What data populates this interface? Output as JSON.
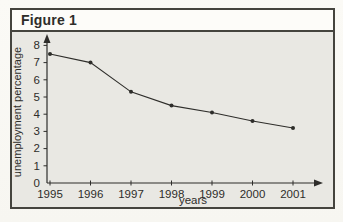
{
  "figure": {
    "label": "Figure 1"
  },
  "colors": {
    "page_bg": "#fbfaf6",
    "box_border": "#45443e",
    "header_bg": "#fdfcf9",
    "plot_bg": "#e9e8e3",
    "line": "#2e2d2a",
    "text": "#2e2d2a"
  },
  "chart_data": {
    "type": "line",
    "title": "Figure 1",
    "x": [
      1995,
      1996,
      1997,
      1998,
      1999,
      2000,
      2001
    ],
    "series": [
      {
        "name": "unemployment percentage",
        "values": [
          7.5,
          7.0,
          5.3,
          4.5,
          4.1,
          3.6,
          3.2
        ]
      }
    ],
    "xlabel": "years",
    "ylabel": "unemployment percentage",
    "ylim": [
      0,
      8
    ],
    "yticks": [
      0,
      1,
      2,
      3,
      4,
      5,
      6,
      7,
      8
    ],
    "grid": false,
    "legend_position": "none",
    "marker": "dot",
    "axis_arrows": true
  }
}
